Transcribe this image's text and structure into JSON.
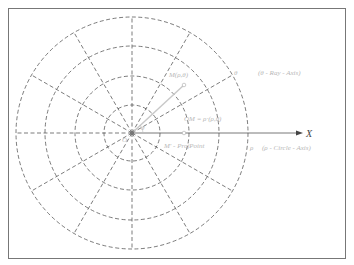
{
  "diagram": {
    "labels": {
      "x_axis": "X",
      "point_m": "M(ρ,θ)",
      "theta_ray": "θ",
      "theta_ray_desc": "(θ - Ray - Axis)",
      "om_vector": "OM = ρ·(ρ,θ)",
      "projection": "M' - ProjPoint",
      "rho_circle": "ρ",
      "rho_circle_desc": "(ρ - Circle - Axis)",
      "origin": "O",
      "angle": "θ"
    },
    "colors": {
      "grid": "#444444",
      "labels": "#b8b8b8",
      "vector": "#c8c8c8",
      "border": "#777777"
    },
    "grid": {
      "circle_count": 4,
      "ray_count": 12
    }
  }
}
